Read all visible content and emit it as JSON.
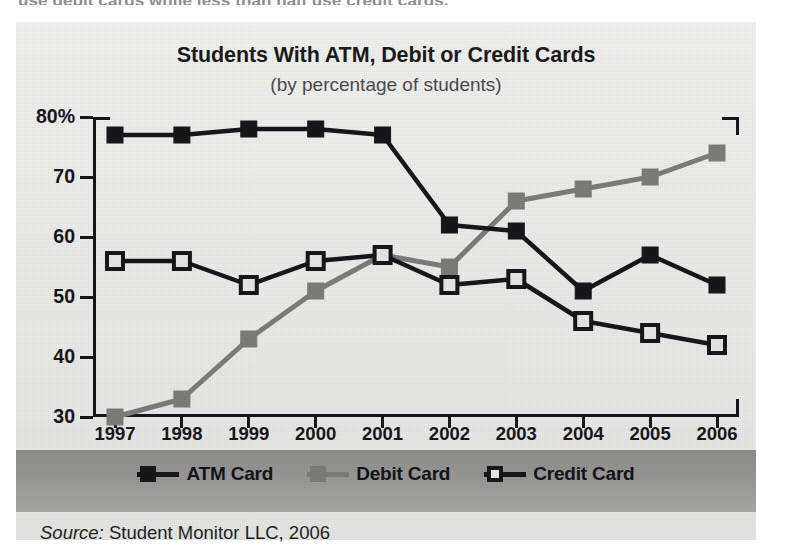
{
  "page": {
    "cutoff_text": "use debit cards while less than half use credit cards.",
    "source_prefix": "Source:",
    "source_text": "Student Monitor LLC, 2006"
  },
  "colors": {
    "atm": "#17171b",
    "debit": "#7c7c7a",
    "credit_fill": "#e6e6e4",
    "credit_line": "#17171b",
    "axis": "#15151a",
    "panel_bg": "#e9e9e7",
    "legend_band": "#989896"
  },
  "legend": {
    "position": "bottom",
    "items": [
      {
        "label": "ATM Card",
        "marker": "filled-square-dark",
        "color": "#17171b"
      },
      {
        "label": "Debit Card",
        "marker": "filled-square-gray",
        "color": "#7c7c7a"
      },
      {
        "label": "Credit Card",
        "marker": "open-square-dark",
        "color": "#17171b"
      }
    ]
  },
  "chart_data": {
    "type": "line",
    "title": "Students With ATM, Debit or Credit Cards",
    "subtitle": "(by percentage of students)",
    "xlabel": "",
    "ylabel": "",
    "grid": false,
    "categories": [
      "1997",
      "1998",
      "1999",
      "2000",
      "2001",
      "2002",
      "2003",
      "2004",
      "2005",
      "2006"
    ],
    "x": [
      1997,
      1998,
      1999,
      2000,
      2001,
      2002,
      2003,
      2004,
      2005,
      2006
    ],
    "ylim": [
      30,
      80
    ],
    "yticks": [
      30,
      40,
      50,
      60,
      70,
      80
    ],
    "ytick_labels": [
      "30",
      "40",
      "50",
      "60",
      "70",
      "80%"
    ],
    "series": [
      {
        "name": "ATM Card",
        "values": [
          77,
          77,
          78,
          78,
          77,
          62,
          61,
          51,
          57,
          52
        ]
      },
      {
        "name": "Debit Card",
        "values": [
          30,
          33,
          43,
          51,
          57,
          55,
          66,
          68,
          70,
          74
        ]
      },
      {
        "name": "Credit Card",
        "values": [
          56,
          56,
          52,
          56,
          57,
          52,
          53,
          46,
          44,
          42
        ]
      }
    ]
  }
}
